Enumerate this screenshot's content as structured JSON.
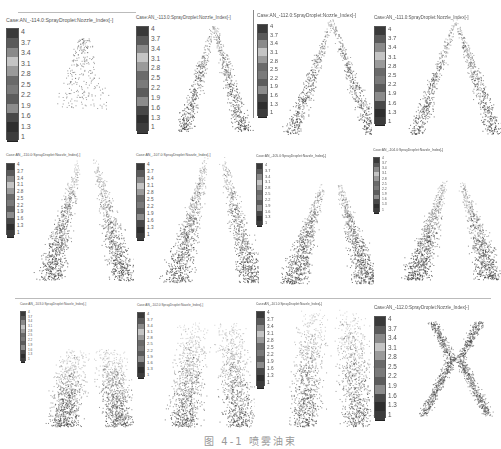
{
  "figure": {
    "caption": "图 4-1  喷雾油束",
    "colorbar_ticks": [
      "4",
      "3.7",
      "3.4",
      "3.1",
      "2.8",
      "2.5",
      "2.2",
      "1.9",
      "1.6",
      "1.3",
      "1"
    ],
    "colorbar_colors": [
      "#3a3a3a",
      "#5a5a5a",
      "#8a8a8a",
      "#c4c4c4",
      "#9a9a9a",
      "#6a6a6a",
      "#7a7a7a",
      "#5c5c5c",
      "#8c8c8c",
      "#484848",
      "#2e2e2e",
      "#3c3c3c"
    ],
    "dot_color": "#4a4a4a",
    "panels": [
      {
        "title": "Case:AN_-114.0:SprayDroplet:Nozzle_Index[-]",
        "shape": "small-cone",
        "x": 4,
        "y": 10,
        "w": 120,
        "h": 140,
        "bar_x": 6,
        "bar_y": 28,
        "bar_h": 112,
        "title_size": 5.2
      },
      {
        "title": "Case:AN_-113.0:SprayDroplet:Nozzle_Index[-]",
        "shape": "cone",
        "x": 135,
        "y": 14,
        "w": 120,
        "h": 130,
        "bar_x": 136,
        "bar_y": 26,
        "bar_h": 105,
        "title_size": 4.6
      },
      {
        "title": "Case:AN_-112.0:SprayDroplet:Nozzle_Index[-]",
        "shape": "cone-wide",
        "x": 252,
        "y": 8,
        "w": 120,
        "h": 140,
        "bar_x": 257,
        "bar_y": 24,
        "bar_h": 92,
        "title_size": 4.8
      },
      {
        "title": "Case:AN_-111.0:SprayDroplet:Nozzle_Index[-]",
        "shape": "cone-wide",
        "x": 372,
        "y": 8,
        "w": 129,
        "h": 140,
        "bar_x": 374,
        "bar_y": 26,
        "bar_h": 98,
        "title_size": 4.6
      },
      {
        "title": "Case:AN_-110.0:SprayDroplet:Nozzle_Index[-]",
        "shape": "plume",
        "x": 4,
        "y": 155,
        "w": 130,
        "h": 135,
        "bar_x": 6,
        "bar_y": 163,
        "bar_h": 72,
        "title_size": 3.6
      },
      {
        "title": "Case:AN_-107.0:SprayDroplet:Nozzle_Index[-]",
        "shape": "plume",
        "x": 134,
        "y": 152,
        "w": 125,
        "h": 140,
        "bar_x": 136,
        "bar_y": 163,
        "bar_h": 75,
        "title_size": 3.6
      },
      {
        "title": "Case:AN_-105.0:SprayDroplet:Nozzle_Index[-]",
        "shape": "plume-late",
        "x": 252,
        "y": 152,
        "w": 122,
        "h": 140,
        "bar_x": 256,
        "bar_y": 163,
        "bar_h": 62,
        "title_size": 3.4
      },
      {
        "title": "Case:AN_-104.0:SprayDroplet:Nozzle_Index[-]",
        "shape": "plume-late",
        "x": 370,
        "y": 148,
        "w": 131,
        "h": 140,
        "bar_x": 373,
        "bar_y": 157,
        "bar_h": 55,
        "title_size": 3.4
      },
      {
        "title": "Case:AN_-103.0:SprayDroplet:Nozzle_Index[-]",
        "shape": "bottom-plume",
        "x": 4,
        "y": 303,
        "w": 130,
        "h": 130,
        "bar_x": 20,
        "bar_y": 311,
        "bar_h": 50,
        "title_size": 3.2
      },
      {
        "title": "Case:AN_-102.0:SprayDroplet:Nozzle_Index[-]",
        "shape": "wide-plume",
        "x": 135,
        "y": 303,
        "w": 120,
        "h": 130,
        "bar_x": 137,
        "bar_y": 312,
        "bar_h": 65,
        "title_size": 3.2
      },
      {
        "title": "Case:AN_-101.0:SprayDroplet:Nozzle_Index[-]",
        "shape": "tall-plume",
        "x": 252,
        "y": 303,
        "w": 122,
        "h": 130,
        "bar_x": 256,
        "bar_y": 311,
        "bar_h": 75,
        "title_size": 3.2
      },
      {
        "title": "Case:AN_-112.0:SprayDroplet:Nozzle_Index[-]",
        "shape": "x-shape",
        "x": 372,
        "y": 303,
        "w": 129,
        "h": 125,
        "bar_x": 374,
        "bar_y": 316,
        "bar_h": 102,
        "title_size": 4.6
      }
    ]
  }
}
